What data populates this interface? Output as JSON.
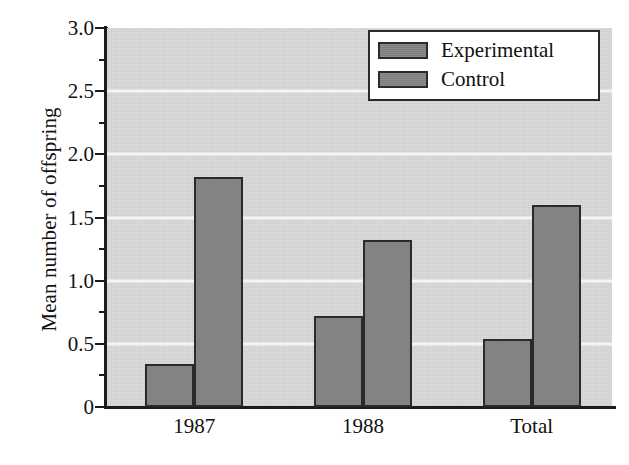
{
  "chart_data": {
    "type": "bar",
    "title": "",
    "xlabel": "",
    "ylabel": "Mean number of offspring",
    "categories": [
      "1987",
      "1988",
      "Total"
    ],
    "series": [
      {
        "name": "Experimental",
        "values": [
          0.34,
          0.72,
          0.54
        ],
        "color": "#838383"
      },
      {
        "name": "Control",
        "values": [
          1.82,
          1.32,
          1.6
        ],
        "color": "#838383"
      }
    ],
    "ylim": [
      0,
      3.0
    ],
    "y_major_ticks": [
      0,
      0.5,
      1.0,
      1.5,
      2.0,
      2.5,
      3.0
    ],
    "y_major_tick_labels": [
      "0",
      "0.5",
      "1.0",
      "1.5",
      "2.0",
      "2.5",
      "3.0"
    ],
    "y_minor_ticks": [
      0.25,
      0.75,
      1.25,
      1.75,
      2.25,
      2.75
    ],
    "grid": "horizontal-major-only",
    "legend_position": "top-right",
    "plot_background_color": "#d6d6d6",
    "gridline_color": "#f4f4f4",
    "bar_edge_color": "#2a2a2a",
    "axis_color": "#1c1c1c"
  },
  "legend": {
    "items": [
      {
        "label": "Experimental"
      },
      {
        "label": "Control"
      }
    ]
  },
  "axes": {
    "y_title": "Mean number of offspring",
    "y_labels": [
      "3.0",
      "2.5",
      "2.0",
      "1.5",
      "1.0",
      "0.5",
      "0"
    ],
    "x_labels": [
      "1987",
      "1988",
      "Total"
    ]
  }
}
